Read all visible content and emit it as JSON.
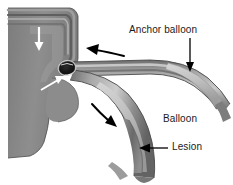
{
  "figure": {
    "name": "anchor-balloon-technique-illustration",
    "background_color": "#ffffff",
    "width": 233,
    "height": 185,
    "labels": {
      "anchor_balloon": "Anchor balloon",
      "balloon": "Balloon",
      "lesion": "Lesion"
    },
    "leaders": [
      {
        "name": "anchor-balloon-leader",
        "type": "vertical-down-arrow",
        "x": 190,
        "y1": 38,
        "y2": 71
      },
      {
        "name": "lesion-leader",
        "type": "horizontal-left-arrow",
        "y": 148,
        "x1": 168,
        "x2": 140
      }
    ],
    "arrows": [
      {
        "name": "aorta-flow-arrow",
        "color": "#ffffff",
        "direction": "down",
        "region": "aorta-lumen"
      },
      {
        "name": "ostium-pointer-arrow",
        "color": "#ffffff",
        "direction": "up-right",
        "region": "vessel-ostium"
      },
      {
        "name": "upper-branch-arrow",
        "color": "#000000",
        "direction": "up-left",
        "region": "anchor-branch"
      },
      {
        "name": "lower-branch-arrow",
        "color": "#000000",
        "direction": "down-right",
        "region": "lesion-branch"
      }
    ],
    "structures": [
      {
        "name": "aorta",
        "fill": "#8a8a8a"
      },
      {
        "name": "aorta-inner-wall",
        "fill": "#b4b4b4"
      },
      {
        "name": "anchor-branch-vessel",
        "fill": "#9a9a9a"
      },
      {
        "name": "lesion-branch-vessel",
        "fill": "#9a9a9a"
      },
      {
        "name": "anchor-balloon-body",
        "fill": "#cfcfcf"
      },
      {
        "name": "balloon-body",
        "fill": "#c9c9c9"
      },
      {
        "name": "lesion-plaque",
        "fill": "#6e6e6e"
      },
      {
        "name": "ostium-marker",
        "fill": "#161616"
      }
    ],
    "colors": {
      "vessel_dark": "#6e6e6e",
      "vessel_mid": "#8a8a8a",
      "vessel_light": "#c9c9c9",
      "outline": "#3a3a3a",
      "label_text": "#1a1a1a"
    }
  }
}
